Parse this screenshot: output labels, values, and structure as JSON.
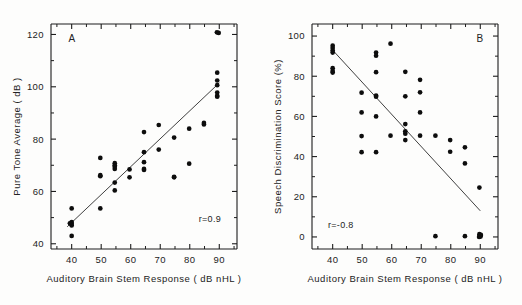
{
  "figure": {
    "background": "#fdfdfc",
    "point_color": "#0d0d0d",
    "axis_color": "#1d1d1d",
    "line_color": "#2a2a2a"
  },
  "chart_data": [
    {
      "type": "scatter",
      "panel_label": "A",
      "title": "",
      "xlabel": "Auditory Brain Stem Response ( dB nHL )",
      "ylabel": "Pure Tone Average  ( dB )",
      "xlim": [
        33,
        96
      ],
      "ylim": [
        38,
        124
      ],
      "xticks": [
        40,
        50,
        60,
        70,
        80,
        90
      ],
      "xtick_labels": [
        "40",
        "50",
        "60",
        "70",
        "80",
        "90"
      ],
      "xminor": [
        35,
        45,
        55,
        65,
        75,
        85,
        95
      ],
      "yticks": [
        40,
        60,
        80,
        100,
        120
      ],
      "ytick_labels": [
        "40",
        "60",
        "80",
        "100",
        "120"
      ],
      "yminor": [
        50,
        70,
        90,
        110
      ],
      "grid": false,
      "annotation": "r=0.9",
      "correlation": 0.9,
      "fit_line": {
        "x0": 38.5,
        "y0": 46.5,
        "x1": 90.0,
        "y1": 101.5
      },
      "points": [
        [
          40,
          53.5
        ],
        [
          40,
          48.3
        ],
        [
          40,
          47.6
        ],
        [
          40,
          47.0
        ],
        [
          39.4,
          47.8
        ],
        [
          40,
          43.0
        ],
        [
          49.7,
          72.8
        ],
        [
          49.7,
          66.2
        ],
        [
          49.7,
          65.8
        ],
        [
          49.7,
          53.5
        ],
        [
          54.6,
          70.8
        ],
        [
          54.6,
          70.0
        ],
        [
          54.6,
          69.4
        ],
        [
          54.6,
          68.6
        ],
        [
          54.6,
          63.4
        ],
        [
          54.6,
          60.4
        ],
        [
          59.6,
          68.4
        ],
        [
          59.6,
          65.4
        ],
        [
          64.5,
          82.7
        ],
        [
          64.5,
          75.0
        ],
        [
          64.5,
          71.2
        ],
        [
          64.5,
          68.6
        ],
        [
          64.5,
          68.2
        ],
        [
          69.5,
          85.4
        ],
        [
          69.5,
          76.0
        ],
        [
          74.7,
          80.6
        ],
        [
          74.7,
          65.6
        ],
        [
          74.7,
          65.4
        ],
        [
          79.8,
          84.0
        ],
        [
          79.8,
          70.6
        ],
        [
          84.8,
          86.2
        ],
        [
          84.8,
          85.6
        ],
        [
          89.2,
          120.8
        ],
        [
          89.8,
          120.6
        ],
        [
          89.3,
          105.4
        ],
        [
          89.3,
          102.4
        ],
        [
          89.3,
          100.6
        ],
        [
          89.3,
          97.8
        ],
        [
          89.3,
          96.6
        ],
        [
          89.3,
          96.2
        ]
      ]
    },
    {
      "type": "scatter",
      "panel_label": "B",
      "title": "",
      "xlabel": "Auditory Brain Stem Response ( dB nHL )",
      "ylabel": "Speech Discrimination Score  (%)",
      "xlim": [
        33,
        96
      ],
      "ylim": [
        -6,
        106
      ],
      "xticks": [
        40,
        50,
        60,
        70,
        80,
        90
      ],
      "xtick_labels": [
        "40",
        "50",
        "60",
        "70",
        "80",
        "90"
      ],
      "xminor": [
        35,
        45,
        55,
        65,
        75,
        85,
        95
      ],
      "yticks": [
        0,
        20,
        40,
        60,
        80,
        100
      ],
      "ytick_labels": [
        "0",
        "20",
        "40",
        "60",
        "80",
        "100"
      ],
      "yminor": [
        10,
        30,
        50,
        70,
        90
      ],
      "grid": false,
      "annotation": "r=-0.8",
      "correlation": -0.8,
      "fit_line": {
        "x0": 40.0,
        "y0": 93.0,
        "x1": 90.0,
        "y1": 13.0
      },
      "points": [
        [
          40,
          95.2
        ],
        [
          40,
          94.0
        ],
        [
          40,
          92.8
        ],
        [
          40,
          91.8
        ],
        [
          40,
          84.0
        ],
        [
          40,
          82.6
        ],
        [
          40,
          81.8
        ],
        [
          49.8,
          71.8
        ],
        [
          49.8,
          62.0
        ],
        [
          49.8,
          50.2
        ],
        [
          49.8,
          42.2
        ],
        [
          54.7,
          91.8
        ],
        [
          54.7,
          90.2
        ],
        [
          54.7,
          82.0
        ],
        [
          54.7,
          70.4
        ],
        [
          54.7,
          69.8
        ],
        [
          54.7,
          60.0
        ],
        [
          54.7,
          42.2
        ],
        [
          59.6,
          96.2
        ],
        [
          59.6,
          50.4
        ],
        [
          64.6,
          82.2
        ],
        [
          64.6,
          70.0
        ],
        [
          64.6,
          56.2
        ],
        [
          64.6,
          52.6
        ],
        [
          64.6,
          51.4
        ],
        [
          64.6,
          48.2
        ],
        [
          69.6,
          78.2
        ],
        [
          69.6,
          72.0
        ],
        [
          69.6,
          62.0
        ],
        [
          69.6,
          50.4
        ],
        [
          74.8,
          50.4
        ],
        [
          74.8,
          0.4
        ],
        [
          79.8,
          48.2
        ],
        [
          79.8,
          42.4
        ],
        [
          84.8,
          44.6
        ],
        [
          84.8,
          36.6
        ],
        [
          84.8,
          0.4
        ],
        [
          89.7,
          24.6
        ],
        [
          89.7,
          1.4
        ],
        [
          89.9,
          0.6
        ],
        [
          90.1,
          0.2
        ],
        [
          89.6,
          0.0
        ],
        [
          90.2,
          1.0
        ]
      ]
    }
  ]
}
